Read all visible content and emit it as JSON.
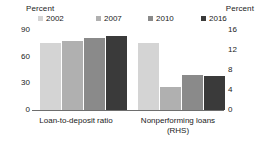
{
  "chart_data": {
    "type": "bar",
    "title": "",
    "categories": [
      "Loan-to-deposit ratio",
      "Nonperforming loans (RHS)"
    ],
    "series": [
      {
        "name": "2002",
        "color": "#d4d4d4",
        "values": [
          75,
          13.5
        ]
      },
      {
        "name": "2007",
        "color": "#b0b0b0",
        "values": [
          78,
          4.7
        ]
      },
      {
        "name": "2010",
        "color": "#8a8a8a",
        "values": [
          81,
          7.0
        ]
      },
      {
        "name": "2016",
        "color": "#3a3a3a",
        "values": [
          83,
          6.9
        ]
      }
    ],
    "axes": {
      "left": {
        "title": "Percent",
        "ticks": [
          "90",
          "60",
          "30",
          "0"
        ],
        "tick_values": [
          90,
          60,
          30,
          0
        ],
        "ylim": [
          0,
          90
        ],
        "applies_to": "Loan-to-deposit ratio"
      },
      "right": {
        "title": "Percent",
        "ticks": [
          "16",
          "12",
          "8",
          "4",
          "0"
        ],
        "tick_values": [
          16,
          12,
          8,
          4,
          0
        ],
        "ylim": [
          0,
          16
        ],
        "applies_to": "Nonperforming loans (RHS)"
      }
    },
    "grid": false,
    "legend_position": "top",
    "legend_entries": [
      "2002",
      "2007",
      "2010",
      "2016"
    ]
  },
  "labels": {
    "left_axis_title": "Percent",
    "right_axis_title": "Percent",
    "category_0_line_1": "Loan-to-deposit ratio",
    "category_1_line_1": "Nonperforming loans",
    "category_1_line_2": "(RHS)"
  }
}
